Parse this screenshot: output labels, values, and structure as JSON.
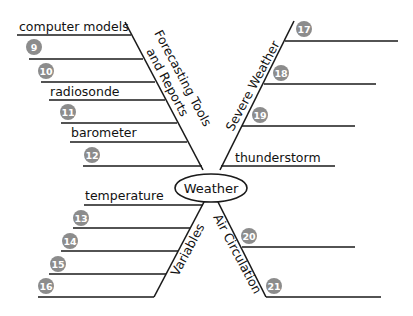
{
  "diagram": {
    "type": "fishbone",
    "center": "Weather",
    "colors": {
      "line": "#1a1a1a",
      "badge": "#8c8c8c",
      "badge_text": "#ffffff"
    },
    "branches": [
      {
        "title_line1": "Forecasting Tools",
        "title_line2": "and Reports",
        "items": [
          {
            "text": "computer models"
          },
          {
            "badge": "9"
          },
          {
            "badge": "10"
          },
          {
            "text": "radiosonde"
          },
          {
            "badge": "11"
          },
          {
            "text": "barometer"
          },
          {
            "badge": "12"
          }
        ]
      },
      {
        "title": "Severe Weather",
        "items": [
          {
            "badge": "17"
          },
          {
            "badge": "18"
          },
          {
            "badge": "19"
          },
          {
            "text": "thunderstorm"
          }
        ]
      },
      {
        "title": "Variables",
        "items": [
          {
            "text": "temperature"
          },
          {
            "badge": "13"
          },
          {
            "badge": "14"
          },
          {
            "badge": "15"
          },
          {
            "badge": "16"
          }
        ]
      },
      {
        "title": "Air Circulation",
        "items": [
          {
            "badge": "20"
          },
          {
            "badge": "21"
          }
        ]
      }
    ]
  }
}
